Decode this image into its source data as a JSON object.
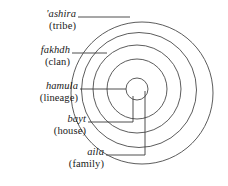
{
  "figure": {
    "type": "concentric-circles-diagram",
    "stroke_color": "#4a4a4a",
    "background_color": "#ffffff"
  },
  "labels": [
    {
      "id": "ashira",
      "term": "'ashira",
      "gloss": "(tribe)",
      "ring_index": 1,
      "ring_name": "outermost"
    },
    {
      "id": "fakhdh",
      "term": "fakhdh",
      "gloss": "(clan)",
      "ring_index": 2,
      "ring_name": "second"
    },
    {
      "id": "hamula",
      "term": "hamula",
      "gloss": "(lineage)",
      "ring_index": 3,
      "ring_name": "third"
    },
    {
      "id": "bayt",
      "term": "bayt",
      "gloss": "(house)",
      "ring_index": 4,
      "ring_name": "fourth"
    },
    {
      "id": "aila",
      "term": "aila",
      "gloss": "(family)",
      "ring_index": 5,
      "ring_name": "innermost"
    }
  ],
  "rings": [
    {
      "id": "ring-ashira",
      "cx": 142,
      "cy": 93,
      "r": 71,
      "label": "'ashira"
    },
    {
      "id": "ring-fakhdh",
      "cx": 139,
      "cy": 90,
      "r": 57.5,
      "label": "fakhdh"
    },
    {
      "id": "ring-hamula",
      "cx": 137,
      "cy": 89,
      "r": 44,
      "label": "hamula"
    },
    {
      "id": "ring-bayt",
      "cx": 137,
      "cy": 89,
      "r": 30,
      "label": "bayt"
    },
    {
      "id": "ring-aila",
      "cx": 137,
      "cy": 89,
      "r": 11,
      "label": "aila"
    }
  ]
}
